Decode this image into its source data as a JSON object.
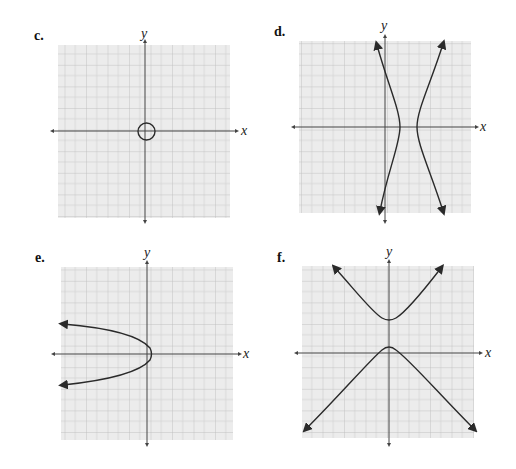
{
  "panels": [
    {
      "id": "c",
      "label": "c.",
      "x_axis_label": "x",
      "y_axis_label": "y",
      "curve": "circle"
    },
    {
      "id": "d",
      "label": "d.",
      "x_axis_label": "x",
      "y_axis_label": "y",
      "curve": "hyperbola-horizontal"
    },
    {
      "id": "e",
      "label": "e.",
      "x_axis_label": "x",
      "y_axis_label": "y",
      "curve": "parabola-left"
    },
    {
      "id": "f",
      "label": "f.",
      "x_axis_label": "x",
      "y_axis_label": "y",
      "curve": "hyperbola-vertical"
    }
  ],
  "style": {
    "grid_bg": "#ececec",
    "grid_minor": "#d2d2d2",
    "grid_major": "#b9b9b9",
    "axis_color": "#444444",
    "curve_color": "#2a2a2a"
  }
}
